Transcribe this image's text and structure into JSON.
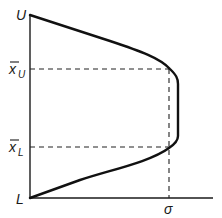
{
  "diagram": {
    "type": "function-profile",
    "labels": {
      "upper_limit": "U",
      "lower_limit": "L",
      "xbar_upper_base": "x",
      "xbar_upper_sub": "U",
      "xbar_lower_base": "x",
      "xbar_lower_sub": "L",
      "sigma": "σ"
    },
    "colors": {
      "line": "#111111",
      "background": "#ffffff"
    }
  }
}
